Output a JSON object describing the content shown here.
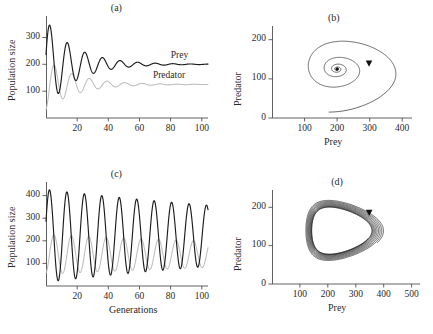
{
  "figure": {
    "panels": [
      {
        "key": "a",
        "label": "(a)"
      },
      {
        "key": "b",
        "label": "(b)"
      },
      {
        "key": "c",
        "label": "(c)"
      },
      {
        "key": "d",
        "label": "(d)"
      }
    ]
  },
  "labels": {
    "population_size": "Population size",
    "generations": "Generations",
    "prey": "Prey",
    "predator": "Predator"
  },
  "chart_data": [
    {
      "panel": "a",
      "type": "line",
      "title": "(a)",
      "xlabel": "",
      "ylabel": "Population size",
      "xlim": [
        0,
        104
      ],
      "ylim": [
        0,
        380
      ],
      "xticks": [
        20,
        40,
        60,
        80,
        100
      ],
      "yticks": [
        100,
        200,
        300
      ],
      "grid": false,
      "legend_position": "inside-right",
      "description": "Damped oscillations converging to a stable equilibrium",
      "equilibrium": {
        "prey": 200,
        "predator": 125
      },
      "model": {
        "kind": "damped-oscillation",
        "prey": {
          "mean": 200,
          "amplitude": 165,
          "decay": 0.052,
          "period": 11.3,
          "phase": 1.35
        },
        "predator": {
          "mean": 125,
          "amplitude": 95,
          "decay": 0.052,
          "period": 11.3,
          "phase": 2.95
        }
      },
      "series": [
        {
          "name": "Prey",
          "color": "#1c1c1c",
          "x": [
            0,
            1,
            2,
            3,
            4,
            5,
            6,
            7,
            8,
            9,
            10,
            11,
            12,
            13,
            14,
            15,
            16,
            17,
            18,
            19,
            20,
            22,
            24,
            26,
            28,
            30,
            33,
            36,
            40,
            45,
            50,
            56,
            62,
            70,
            80,
            90,
            100
          ],
          "values": [
            205,
            300,
            352,
            330,
            250,
            170,
            132,
            126,
            140,
            170,
            207,
            240,
            258,
            262,
            247,
            220,
            192,
            172,
            164,
            167,
            182,
            216,
            240,
            247,
            232,
            206,
            180,
            186,
            213,
            221,
            190,
            187,
            207,
            203,
            196,
            199,
            199
          ]
        },
        {
          "name": "Predator",
          "color": "#bdbdbd",
          "x": [
            0,
            1,
            2,
            3,
            4,
            5,
            6,
            7,
            8,
            9,
            10,
            11,
            12,
            13,
            14,
            15,
            16,
            17,
            18,
            19,
            20,
            22,
            24,
            26,
            28,
            30,
            33,
            36,
            40,
            45,
            50,
            56,
            62,
            70,
            80,
            90,
            100
          ],
          "values": [
            62,
            80,
            112,
            142,
            154,
            146,
            126,
            104,
            88,
            82,
            86,
            99,
            116,
            133,
            145,
            148,
            142,
            130,
            117,
            110,
            110,
            124,
            141,
            151,
            148,
            136,
            120,
            118,
            131,
            141,
            130,
            120,
            125,
            128,
            123,
            124,
            125
          ]
        }
      ]
    },
    {
      "panel": "b",
      "type": "line",
      "title": "(b)",
      "xlabel": "Prey",
      "ylabel": "Predator",
      "xlim": [
        0,
        430
      ],
      "ylim": [
        0,
        235
      ],
      "xticks": [
        100,
        200,
        300,
        400
      ],
      "yticks": [
        0,
        100,
        200
      ],
      "grid": false,
      "legend_position": "none",
      "description": "Phase portrait: inward spiral to stable focus at (200, 125)",
      "equilibrium": {
        "prey": 200,
        "predator": 125
      },
      "arrow_marker": {
        "prey": 298,
        "predator": 140,
        "direction": "down"
      },
      "model": {
        "kind": "inward-spiral",
        "center_x": 200,
        "center_y": 125,
        "start_radius_x": 160,
        "start_radius_y": 92,
        "decay_per_turn": 0.42,
        "turns": 4.4,
        "start_angle": -0.35
      }
    },
    {
      "panel": "c",
      "type": "line",
      "title": "(c)",
      "xlabel": "Generations",
      "ylabel": "Population size",
      "xlim": [
        0,
        104
      ],
      "ylim": [
        0,
        460
      ],
      "xticks": [
        20,
        40,
        60,
        80,
        100
      ],
      "yticks": [
        100,
        200,
        300,
        400
      ],
      "grid": false,
      "legend_position": "none",
      "description": "Sustained, weakly damped oscillations approaching a limit cycle",
      "model": {
        "kind": "weakly-damped-oscillation",
        "prey": {
          "mean": 222,
          "amplitude": 205,
          "decay": 0.004,
          "period": 11.2,
          "phase": 1.25
        },
        "predator": {
          "mean": 140,
          "amplitude": 88,
          "decay": 0.004,
          "period": 11.2,
          "phase": 2.85
        }
      },
      "series": [
        {
          "name": "Prey",
          "color": "#1c1c1c",
          "x": [
            0,
            2,
            4,
            6,
            8,
            10,
            12,
            14,
            16,
            18,
            20,
            22,
            24,
            26,
            28,
            30,
            36,
            42,
            48,
            54,
            60,
            66,
            72,
            78,
            84,
            90,
            96,
            100
          ],
          "values": [
            300,
            425,
            300,
            130,
            95,
            175,
            330,
            385,
            260,
            125,
            100,
            215,
            355,
            358,
            200,
            110,
            345,
            340,
            105,
            335,
            338,
            105,
            330,
            332,
            108,
            325,
            330,
            120
          ]
        },
        {
          "name": "Predator",
          "color": "#bdbdbd",
          "x": [
            0,
            2,
            4,
            6,
            8,
            10,
            12,
            14,
            16,
            18,
            20,
            22,
            24,
            26,
            28,
            30,
            36,
            42,
            48,
            54,
            60,
            66,
            72,
            78,
            84,
            90,
            96,
            100
          ],
          "values": [
            62,
            150,
            215,
            200,
            110,
            62,
            95,
            190,
            225,
            150,
            70,
            72,
            155,
            218,
            205,
            105,
            215,
            200,
            70,
            208,
            200,
            72,
            205,
            200,
            75,
            200,
            200,
            90
          ]
        }
      ]
    },
    {
      "panel": "d",
      "type": "line",
      "title": "(d)",
      "xlabel": "Prey",
      "ylabel": "Predator",
      "xlim": [
        0,
        530
      ],
      "ylim": [
        0,
        245
      ],
      "xticks": [
        100,
        200,
        300,
        400,
        500
      ],
      "yticks": [
        0,
        100,
        200
      ],
      "grid": false,
      "legend_position": "none",
      "description": "Phase portrait: trajectory spirals onto a teardrop-shaped stable limit cycle",
      "arrow_marker": {
        "prey": 348,
        "predator": 186,
        "direction": "down"
      },
      "limit_cycle": {
        "prey_min": 95,
        "prey_max": 340,
        "predator_min": 78,
        "predator_max": 200
      },
      "model": {
        "kind": "limit-cycle-approach",
        "laps": 9,
        "shrink": 0.3
      }
    }
  ]
}
